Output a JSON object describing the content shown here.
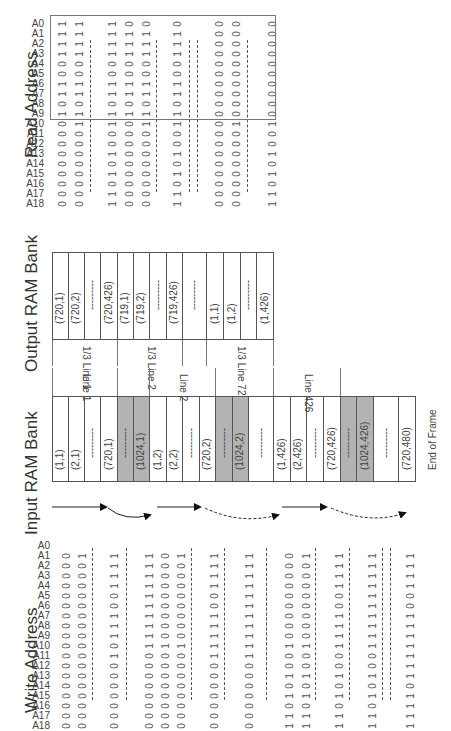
{
  "titles": {
    "read_address": "Read Address",
    "output_ram": "Output RAM Bank",
    "input_ram": "Input RAM Bank",
    "write_address": "Write Address",
    "end_of_frame": "End of Frame"
  },
  "address_labels": [
    "A0",
    "A1",
    "A2",
    "A3",
    "A4",
    "A5",
    "A6",
    "A7",
    "A8",
    "A9",
    "A10",
    "A11",
    "A12",
    "A13",
    "A14",
    "A15",
    "A16",
    "A17",
    "A18"
  ],
  "read_address": {
    "columns": [
      {
        "bits": "1111001101000000000"
      },
      {
        "bits": "1111001101100000000"
      },
      {
        "bits": "1111001101100101011"
      },
      {
        "bits": "0111001101000000000"
      },
      {
        "bits": "0111001101100000000"
      },
      {
        "bits": "0111001101100101011"
      },
      {
        "bits": "0000000000000000000"
      },
      {
        "bits": "0000000000100000000"
      },
      {
        "bits": "0000000000100101011"
      }
    ]
  },
  "output_ram": {
    "cells": [
      "(720,1)",
      "(720,2)",
      "---------",
      "(720,426)",
      "(719,1)",
      "(719,2)",
      "---------",
      "(719,426)",
      "---------",
      "(1,1)",
      "(1,2)",
      "---------",
      "(1,426)"
    ],
    "groups": [
      "1/3 Line 1",
      "1/3 Line 2",
      "",
      "1/3 Line 720"
    ]
  },
  "input_ram": {
    "cells": [
      "(1,1)",
      "(2,1)",
      "---------",
      "(720,1)",
      "---------",
      "(1024,1)",
      "(1,2)",
      "(2,2)",
      "---------",
      "(720,2)",
      "---------",
      "(1024,2)",
      "---------",
      "(1,426)",
      "(2,426)",
      "---------",
      "(720,426)",
      "---------",
      "(1024,426)",
      "---------",
      "(720,480)"
    ],
    "groups": [
      "Line 1",
      "",
      "Line 2",
      "",
      "Line 426",
      ""
    ]
  },
  "write_address": {
    "columns": [
      {
        "bits": "000000000000000000"
      },
      {
        "bits": "100000000000000000"
      },
      {
        "bits": "111100111010000000"
      },
      {
        "bits": "111111111100000000"
      },
      {
        "bits": "000000000100000000"
      },
      {
        "bits": "100000000100000000"
      },
      {
        "bits": "111100111110000000"
      },
      {
        "bits": "111111111110000000"
      },
      {
        "bits": "000000000100101011"
      },
      {
        "bits": "100000000100101011"
      },
      {
        "bits": "111100111100101011"
      },
      {
        "bits": "111111111100101011"
      },
      {
        "bits": "111100111111101111"
      }
    ]
  }
}
